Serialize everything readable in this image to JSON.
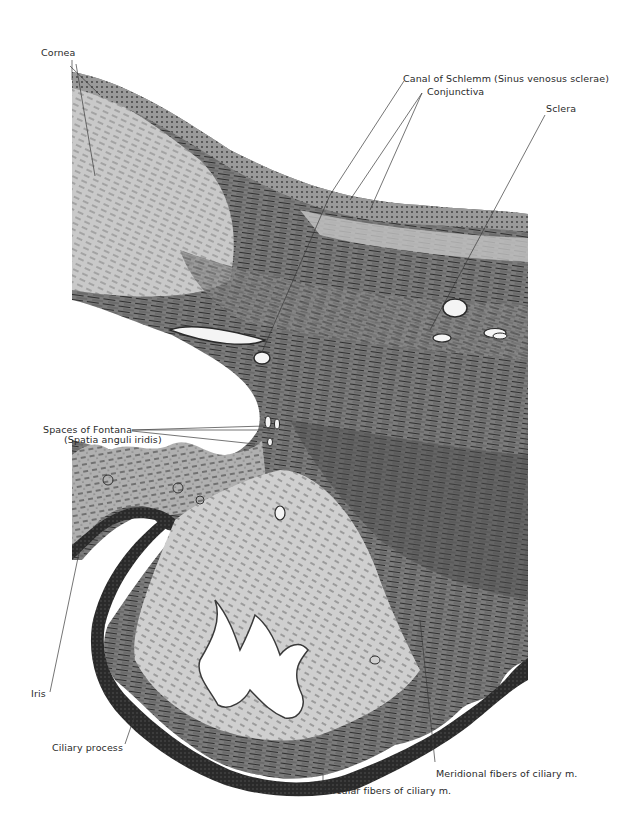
{
  "figure": {
    "colors": {
      "background": "#ffffff",
      "tissue_dark": "#2b2b2b",
      "tissue_mid": "#6e6e6e",
      "tissue_light": "#b8b8b8",
      "tissue_pale": "#d9d9d9",
      "label_text": "#2a2a2a",
      "leader_line": "#3a3a3a"
    },
    "labels": {
      "cornea": "Cornea",
      "canal_of_schlemm": "Canal of Schlemm (Sinus venosus sclerae)",
      "conjunctiva": "Conjunctiva",
      "sclera": "Sclera",
      "spaces_of_fontana": "Spaces of Fontana",
      "spatia_anguli_iridis": "(Spatia anguli iridis)",
      "iris": "Iris",
      "ciliary_process": "Ciliary process",
      "meridional_fibers": "Meridional fibers of ciliary m.",
      "circular_fibers": "Circular fibers of ciliary m."
    }
  }
}
